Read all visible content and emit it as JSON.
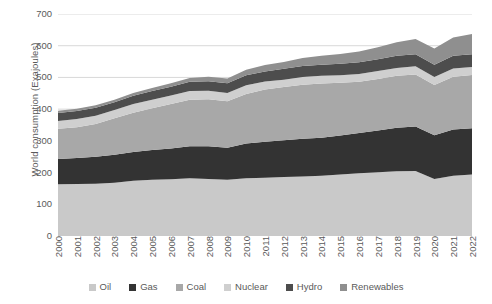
{
  "chart_data": {
    "type": "area",
    "stacked": true,
    "title": "",
    "subtitle": "",
    "xlabel": "",
    "ylabel": "World consumption (Exajoules)",
    "ylim": [
      0,
      700
    ],
    "ytick_step": 100,
    "yticks": [
      700,
      600,
      500,
      400,
      300,
      200,
      100,
      0
    ],
    "grid": true,
    "grid_axis": "y",
    "legend_position": "bottom",
    "categories": [
      "2000",
      "2001",
      "2002",
      "2003",
      "2004",
      "2005",
      "2006",
      "2007",
      "2008",
      "2009",
      "2010",
      "2011",
      "2012",
      "2013",
      "2014",
      "2015",
      "2016",
      "2017",
      "2018",
      "2019",
      "2020",
      "2021",
      "2022"
    ],
    "series": [
      {
        "name": "Oil",
        "color": "#c9c9c9",
        "values": [
          163,
          164,
          165,
          168,
          174,
          177,
          179,
          182,
          180,
          177,
          182,
          184,
          186,
          188,
          190,
          194,
          198,
          201,
          204,
          205,
          180,
          190,
          194
        ]
      },
      {
        "name": "Gas",
        "color": "#333333",
        "values": [
          80,
          82,
          85,
          88,
          91,
          94,
          97,
          101,
          103,
          101,
          110,
          113,
          116,
          119,
          120,
          123,
          127,
          132,
          137,
          140,
          138,
          146,
          146
        ]
      },
      {
        "name": "Coal",
        "color": "#a8a8a8",
        "values": [
          95,
          97,
          103,
          115,
          124,
          132,
          140,
          147,
          148,
          147,
          156,
          165,
          168,
          170,
          171,
          166,
          161,
          162,
          164,
          164,
          158,
          166,
          168
        ]
      },
      {
        "name": "Nuclear",
        "color": "#cfcfcf",
        "values": [
          25,
          26,
          26,
          26,
          27,
          27,
          27,
          27,
          27,
          26,
          27,
          25,
          23,
          24,
          24,
          24,
          25,
          25,
          25,
          26,
          25,
          26,
          25
        ]
      },
      {
        "name": "Hydro",
        "color": "#4d4d4d",
        "values": [
          25,
          25,
          25,
          25,
          26,
          27,
          28,
          29,
          30,
          31,
          32,
          32,
          34,
          35,
          35,
          36,
          37,
          37,
          38,
          38,
          39,
          40,
          40
        ]
      },
      {
        "name": "Renewables",
        "color": "#8f8f8f",
        "values": [
          7,
          7,
          8,
          8,
          9,
          10,
          11,
          12,
          14,
          15,
          17,
          20,
          22,
          25,
          28,
          31,
          34,
          38,
          43,
          48,
          51,
          58,
          64
        ]
      }
    ]
  },
  "legend": {
    "items": [
      {
        "label": "Oil",
        "color": "#c9c9c9"
      },
      {
        "label": "Gas",
        "color": "#333333"
      },
      {
        "label": "Coal",
        "color": "#a8a8a8"
      },
      {
        "label": "Nuclear",
        "color": "#cfcfcf"
      },
      {
        "label": "Hydro",
        "color": "#4d4d4d"
      },
      {
        "label": "Renewables",
        "color": "#8f8f8f"
      }
    ]
  },
  "style": {
    "grid_color": "#d9d9d9",
    "text_color": "#5a5a5a",
    "background": "#ffffff"
  }
}
